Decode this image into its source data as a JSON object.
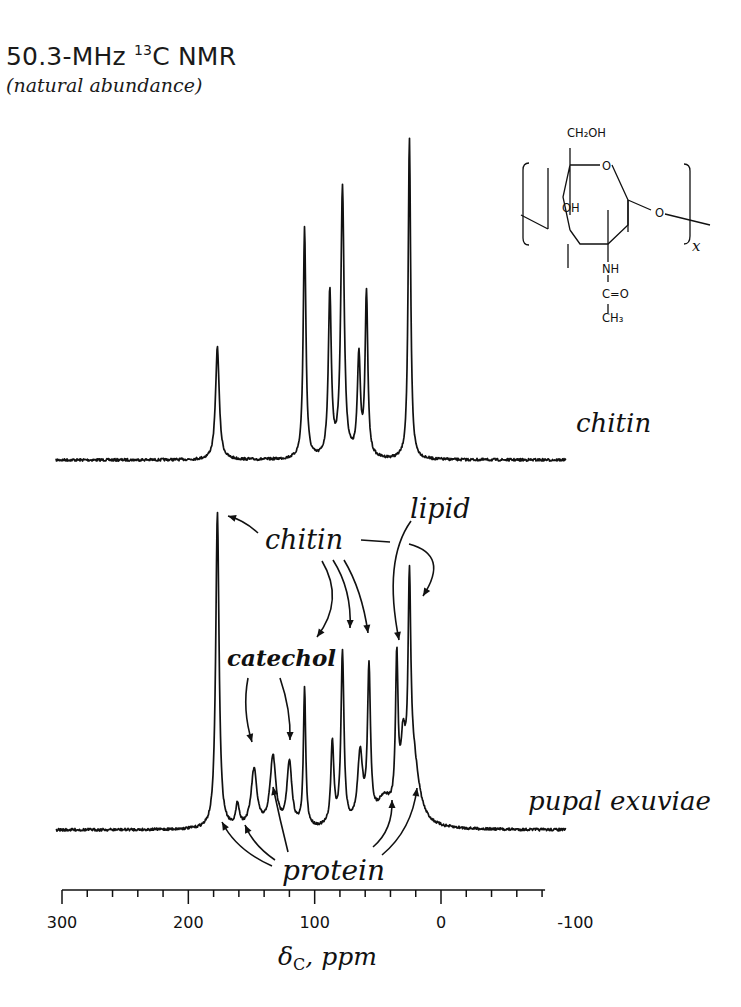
{
  "header": {
    "title_main": "50.3-MHz ",
    "title_isotope_sup": "13",
    "title_rest": "C NMR",
    "subtitle": "(natural abundance)"
  },
  "structure": {
    "substituents": [
      "CH₂OH",
      "O",
      "OH",
      "O",
      "NH",
      "C=O",
      "CH₃"
    ],
    "repeat_subscript": "x"
  },
  "chart_data": {
    "type": "line",
    "xlabel": "δC, ppm",
    "xlabel_main": "δ",
    "xlabel_sub": "C",
    "xlabel_rest": ", ppm",
    "ylabel": "",
    "xlim": [
      300,
      -100
    ],
    "x_reversed": true,
    "x_major_ticks": [
      300,
      200,
      100,
      0,
      -100
    ],
    "x_tick_labels": [
      "300",
      "200",
      "100",
      "0",
      "-100"
    ],
    "x_minor_tick_step": 20,
    "x_axis_end": -80,
    "grid": false,
    "series": [
      {
        "name": "chitin",
        "label": "chitin",
        "peaks": [
          {
            "ppm": 177,
            "intensity": 0.35,
            "width": 2.2
          },
          {
            "ppm": 108,
            "intensity": 0.72,
            "width": 1.6
          },
          {
            "ppm": 88,
            "intensity": 0.51,
            "width": 1.8
          },
          {
            "ppm": 78,
            "intensity": 0.84,
            "width": 2.0
          },
          {
            "ppm": 65,
            "intensity": 0.31,
            "width": 1.8
          },
          {
            "ppm": 59,
            "intensity": 0.51,
            "width": 1.6
          },
          {
            "ppm": 25,
            "intensity": 1.0,
            "width": 1.5
          }
        ]
      },
      {
        "name": "pupal exuviae",
        "label": "pupal exuviae",
        "peaks": [
          {
            "ppm": 177,
            "intensity": 0.99,
            "width": 2.0
          },
          {
            "ppm": 161,
            "intensity": 0.07,
            "width": 2.0
          },
          {
            "ppm": 148,
            "intensity": 0.18,
            "width": 3.5
          },
          {
            "ppm": 133,
            "intensity": 0.22,
            "width": 3.5
          },
          {
            "ppm": 120,
            "intensity": 0.2,
            "width": 3.0
          },
          {
            "ppm": 108,
            "intensity": 0.43,
            "width": 1.4
          },
          {
            "ppm": 86,
            "intensity": 0.26,
            "width": 1.8
          },
          {
            "ppm": 78,
            "intensity": 0.54,
            "width": 1.8
          },
          {
            "ppm": 64,
            "intensity": 0.22,
            "width": 3.0
          },
          {
            "ppm": 57,
            "intensity": 0.47,
            "width": 1.8
          },
          {
            "ppm": 35,
            "intensity": 0.47,
            "width": 1.5
          },
          {
            "ppm": 30,
            "intensity": 0.2,
            "width": 3.0
          },
          {
            "ppm": 25,
            "intensity": 0.62,
            "width": 1.6
          },
          {
            "ppm": 22,
            "intensity": 0.2,
            "width": 7.0
          },
          {
            "ppm": 45,
            "intensity": 0.08,
            "width": 9.0
          }
        ]
      }
    ],
    "annotations": [
      {
        "text": "chitin",
        "targets_ppm": [
          177,
          108,
          78,
          57
        ]
      },
      {
        "text": "lipid",
        "targets_ppm": [
          30,
          25
        ]
      },
      {
        "text": "catechol",
        "targets_ppm": [
          148,
          120
        ]
      },
      {
        "text": "protein",
        "targets_ppm": [
          173,
          161,
          133,
          45,
          22
        ]
      }
    ]
  }
}
